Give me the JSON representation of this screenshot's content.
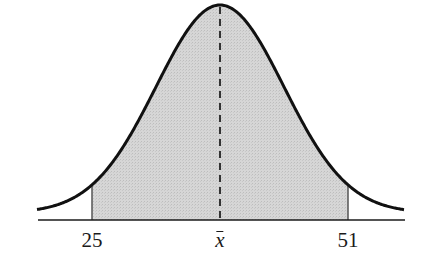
{
  "chart_data": {
    "type": "area",
    "title": "",
    "xlabel": "",
    "ylabel": "",
    "tick_labels": [
      "25",
      "x̄",
      "51"
    ],
    "shaded_region": {
      "from": 25,
      "to": 51
    },
    "mean": {
      "label": "x̄",
      "value": 38,
      "line_style": "dashed"
    },
    "grid": false,
    "legend": null,
    "colors": {
      "curve": "#111111",
      "fill": "#d3d3d3",
      "axis": "#1a1a1a",
      "mean_line": "#333333"
    }
  },
  "labels": {
    "left": "25",
    "mean": "x̄",
    "right": "51"
  }
}
